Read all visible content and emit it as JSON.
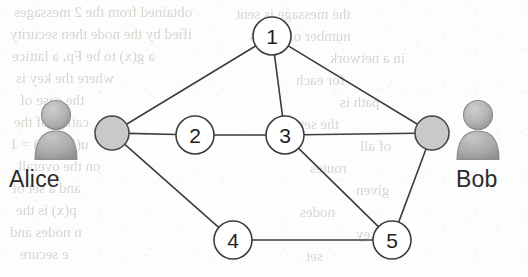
{
  "figure": {
    "type": "network-graph",
    "background": "scanned book page with faint reverse-side bleed-through text"
  },
  "endpoints": [
    {
      "id": "alice",
      "label": "Alice",
      "avatar_icon": "person-avatar-icon",
      "node_fill": "#c9c9c9",
      "node_stroke": "#4a4a4a",
      "x": 112,
      "y": 133,
      "r": 17,
      "avatar_x": 30,
      "avatar_y": 98,
      "label_x": 9,
      "label_y": 168
    },
    {
      "id": "bob",
      "label": "Bob",
      "avatar_icon": "person-avatar-icon",
      "node_fill": "#c9c9c9",
      "node_stroke": "#4a4a4a",
      "x": 432,
      "y": 133,
      "r": 17,
      "avatar_x": 452,
      "avatar_y": 98,
      "label_x": 456,
      "label_y": 168
    }
  ],
  "relay_nodes": [
    {
      "id": "n1",
      "label": "1",
      "x": 272,
      "y": 36,
      "r": 19
    },
    {
      "id": "n2",
      "label": "2",
      "x": 195,
      "y": 135,
      "r": 19
    },
    {
      "id": "n3",
      "label": "3",
      "x": 285,
      "y": 135,
      "r": 19
    },
    {
      "id": "n4",
      "label": "4",
      "x": 233,
      "y": 240,
      "r": 19
    },
    {
      "id": "n5",
      "label": "5",
      "x": 392,
      "y": 240,
      "r": 19
    }
  ],
  "edges": [
    {
      "from": "alice",
      "to": "n1"
    },
    {
      "from": "alice",
      "to": "n2"
    },
    {
      "from": "alice",
      "to": "n4"
    },
    {
      "from": "n1",
      "to": "n3"
    },
    {
      "from": "n1",
      "to": "bob"
    },
    {
      "from": "n2",
      "to": "n3"
    },
    {
      "from": "n3",
      "to": "bob"
    },
    {
      "from": "n3",
      "to": "n5"
    },
    {
      "from": "n4",
      "to": "n5"
    },
    {
      "from": "n5",
      "to": "bob"
    }
  ],
  "style": {
    "edge_color": "#3d3d3d",
    "edge_width": 1.6,
    "node_fill": "#ffffff",
    "node_stroke": "#3d3d3d",
    "node_stroke_width": 1.6,
    "node_label_color": "#1f1f1f",
    "node_label_size": 21,
    "avatar_body_color": "#a8a8a8",
    "avatar_head_color": "#b4b4b4",
    "avatar_outline_color": "#8e8e8e",
    "label_color": "#2b2b2b",
    "paper_color": "#fdfdfc",
    "ghost_text_color": "#b9b6b1"
  },
  "ghost_text_lines": [
    {
      "text": "obtained from the 2 messages",
      "x": 14,
      "y": 4,
      "size": 15
    },
    {
      "text": "ified by the node then security",
      "x": 10,
      "y": 26,
      "size": 15
    },
    {
      "text": "a g(x) to be Fp, a lattice",
      "x": 12,
      "y": 48,
      "size": 15
    },
    {
      "text": "where the key is",
      "x": 16,
      "y": 70,
      "size": 15
    },
    {
      "text": "the case of",
      "x": 20,
      "y": 92,
      "size": 15
    },
    {
      "text": "cation of the",
      "x": 14,
      "y": 114,
      "size": 15
    },
    {
      "text": "u(i) p(j,i) = 1",
      "x": 10,
      "y": 136,
      "size": 15
    },
    {
      "text": "on the overall",
      "x": 18,
      "y": 158,
      "size": 15
    },
    {
      "text": "and a set of",
      "x": 12,
      "y": 180,
      "size": 15
    },
    {
      "text": "p(x) is the",
      "x": 16,
      "y": 202,
      "size": 15
    },
    {
      "text": "n nodes and",
      "x": 10,
      "y": 224,
      "size": 15
    },
    {
      "text": "e secure",
      "x": 20,
      "y": 246,
      "size": 15
    },
    {
      "text": "the message is sent",
      "x": 236,
      "y": 6,
      "size": 15
    },
    {
      "text": "number of nodes",
      "x": 250,
      "y": 28,
      "size": 15
    },
    {
      "text": "in a network",
      "x": 330,
      "y": 50,
      "size": 15
    },
    {
      "text": "for each",
      "x": 296,
      "y": 72,
      "size": 15
    },
    {
      "text": "path is",
      "x": 340,
      "y": 94,
      "size": 15
    },
    {
      "text": "the set",
      "x": 300,
      "y": 116,
      "size": 15
    },
    {
      "text": "of all",
      "x": 360,
      "y": 138,
      "size": 15
    },
    {
      "text": "routes",
      "x": 310,
      "y": 160,
      "size": 15
    },
    {
      "text": "given",
      "x": 356,
      "y": 182,
      "size": 15
    },
    {
      "text": "nodes",
      "x": 300,
      "y": 204,
      "size": 15
    },
    {
      "text": "key",
      "x": 356,
      "y": 226,
      "size": 15
    },
    {
      "text": "set",
      "x": 306,
      "y": 248,
      "size": 15
    }
  ]
}
